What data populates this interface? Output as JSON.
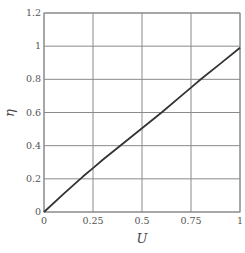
{
  "chart_data": {
    "type": "line",
    "title": "",
    "xlabel": "U",
    "ylabel": "η",
    "xlim": [
      0,
      1
    ],
    "ylim": [
      0,
      1.2
    ],
    "grid": true,
    "legend": null,
    "x_ticks": [
      "0",
      "0.25",
      "0.5",
      "0.75",
      "1"
    ],
    "x_tick_values": [
      0,
      0.25,
      0.5,
      0.75,
      1
    ],
    "y_ticks": [
      "0",
      "0.2",
      "0.4",
      "0.6",
      "0.8",
      "1",
      "1.2"
    ],
    "y_tick_values": [
      0,
      0.2,
      0.4,
      0.6,
      0.8,
      1.0,
      1.2
    ],
    "series": [
      {
        "name": "η(U)",
        "color": "#333333",
        "x": [
          0,
          0.1,
          0.2,
          0.25,
          0.3,
          0.4,
          0.5,
          0.6,
          0.7,
          0.75,
          0.8,
          0.9,
          1.0
        ],
        "y": [
          0,
          0.11,
          0.215,
          0.265,
          0.315,
          0.41,
          0.505,
          0.6,
          0.7,
          0.75,
          0.8,
          0.895,
          0.99
        ]
      }
    ]
  },
  "style": {
    "grid_color": "#8a8a8a",
    "line_color": "#333333",
    "background": "#ffffff"
  }
}
